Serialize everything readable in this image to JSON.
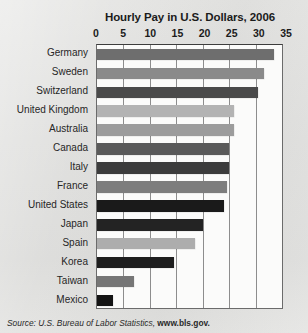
{
  "chart_data": {
    "type": "bar",
    "orientation": "horizontal",
    "title": "Hourly Pay in U.S. Dollars, 2006",
    "xlabel": "",
    "ylabel": "",
    "xlim": [
      0,
      35
    ],
    "xticks": [
      0,
      5,
      10,
      15,
      20,
      25,
      30,
      35
    ],
    "grid": true,
    "legend": null,
    "categories": [
      "Germany",
      "Sweden",
      "Switzerland",
      "United Kingdom",
      "Australia",
      "Canada",
      "Italy",
      "France",
      "United States",
      "Japan",
      "Spain",
      "Korea",
      "Taiwan",
      "Mexico"
    ],
    "values": [
      33.5,
      31.5,
      30.5,
      26,
      26,
      25,
      25,
      24.5,
      24,
      20,
      18.5,
      14.5,
      7,
      3
    ],
    "bar_colors": [
      "#6e6e6e",
      "#8a8a8a",
      "#4a4a4a",
      "#b3b3b3",
      "#9c9c9c",
      "#5a5a5a",
      "#3c3c3c",
      "#7d7d7d",
      "#1a1a1a",
      "#232323",
      "#adadad",
      "#1e1e1e",
      "#767676",
      "#141414"
    ]
  },
  "source": {
    "prefix": "Source: U.S. Bureau of Labor Statistics, ",
    "url": "www.bls.gov."
  }
}
